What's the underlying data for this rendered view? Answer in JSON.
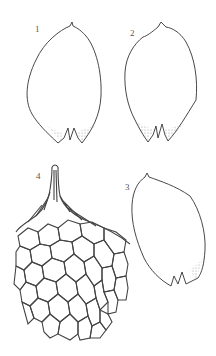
{
  "plate": {
    "figures": [
      {
        "id": "1",
        "label": "1",
        "subject": "leaf",
        "label_pos": [
          36,
          24
        ]
      },
      {
        "id": "2",
        "label": "2",
        "subject": "leaf",
        "label_pos": [
          130,
          28
        ]
      },
      {
        "id": "3",
        "label": "3",
        "subject": "leaf",
        "label_pos": [
          125,
          181
        ]
      },
      {
        "id": "4",
        "label": "4",
        "subject": "leaf apex cells",
        "label_pos": [
          36,
          170
        ]
      }
    ],
    "colors": {
      "line": "#333333",
      "shade": "#bbbbbb",
      "label": "#555555",
      "background": "#ffffff"
    }
  }
}
